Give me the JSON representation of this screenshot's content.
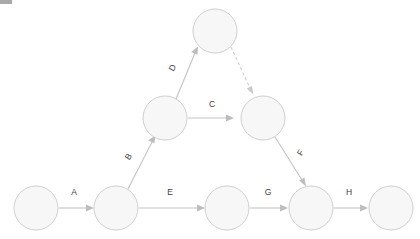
{
  "diagram": {
    "type": "directed-graph",
    "canvas": {
      "width": 420,
      "height": 239,
      "background": "#ffffff"
    },
    "style": {
      "node_fill": "#f7f7f7",
      "node_stroke": "#cfcfcf",
      "edge_color": "#c4c4c4",
      "dashed_edge_color": "#cccccc",
      "label_color": "#3d3d3d"
    },
    "nodes": [
      {
        "id": "n1",
        "label": "",
        "cx": 36,
        "cy": 208,
        "r": 22
      },
      {
        "id": "n2",
        "label": "",
        "cx": 116,
        "cy": 208,
        "r": 22
      },
      {
        "id": "n3",
        "label": "",
        "cx": 227,
        "cy": 208,
        "r": 22
      },
      {
        "id": "n4",
        "label": "",
        "cx": 311,
        "cy": 208,
        "r": 22
      },
      {
        "id": "n5",
        "label": "",
        "cx": 391,
        "cy": 208,
        "r": 22
      },
      {
        "id": "n6",
        "label": "",
        "cx": 165,
        "cy": 118,
        "r": 22
      },
      {
        "id": "n7",
        "label": "",
        "cx": 263,
        "cy": 118,
        "r": 22
      },
      {
        "id": "n8",
        "label": "",
        "cx": 215,
        "cy": 31,
        "r": 22
      }
    ],
    "edges": [
      {
        "id": "e-a",
        "label": "A",
        "from": "n1",
        "to": "n2",
        "style": "solid",
        "label_x": 74,
        "label_y": 193,
        "label_rotation": 0
      },
      {
        "id": "e-b",
        "label": "B",
        "from": "n2",
        "to": "n6",
        "style": "solid",
        "label_x": 129,
        "label_y": 157,
        "label_rotation": -57
      },
      {
        "id": "e-c",
        "label": "C",
        "from": "n6",
        "to": "n7",
        "style": "solid",
        "label_x": 212,
        "label_y": 105,
        "label_rotation": 0
      },
      {
        "id": "e-d",
        "label": "D",
        "from": "n6",
        "to": "n8",
        "style": "solid",
        "label_x": 173,
        "label_y": 68,
        "label_rotation": -62
      },
      {
        "id": "e-dashed",
        "label": "",
        "from": "n8",
        "to": "n7",
        "style": "dashed",
        "label_x": 0,
        "label_y": 0,
        "label_rotation": 0
      },
      {
        "id": "e-e",
        "label": "E",
        "from": "n2",
        "to": "n3",
        "style": "solid",
        "label_x": 170,
        "label_y": 193,
        "label_rotation": 0
      },
      {
        "id": "e-f",
        "label": "F",
        "from": "n7",
        "to": "n4",
        "style": "solid",
        "label_x": 301,
        "label_y": 153,
        "label_rotation": -61
      },
      {
        "id": "e-g",
        "label": "G",
        "from": "n3",
        "to": "n4",
        "style": "solid",
        "label_x": 268,
        "label_y": 193,
        "label_rotation": 0
      },
      {
        "id": "e-h",
        "label": "H",
        "from": "n4",
        "to": "n5",
        "style": "solid",
        "label_x": 349,
        "label_y": 193,
        "label_rotation": 0
      }
    ]
  }
}
